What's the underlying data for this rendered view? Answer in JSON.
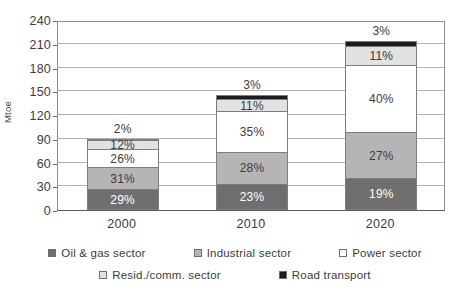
{
  "title_fragment": "",
  "axis": {
    "ylabel": "Mtoe",
    "yticks": [
      "0",
      "30",
      "60",
      "90",
      "120",
      "150",
      "180",
      "210",
      "240"
    ]
  },
  "categories": [
    "2000",
    "2010",
    "2020"
  ],
  "legend": {
    "row1": [
      {
        "label": "Oil & gas sector",
        "swatch": "#6f6f6f"
      },
      {
        "label": "Industrial sector",
        "swatch": "#b5b5b5"
      },
      {
        "label": "Power sector",
        "swatch": "#ffffff"
      }
    ],
    "row2": [
      {
        "label": "Resid./comm. sector",
        "swatch": "#e2e2e2"
      },
      {
        "label": "Road transport",
        "swatch": "#1c1c1c"
      }
    ]
  },
  "labels": {
    "2000": {
      "oil_gas": "29%",
      "industrial": "31%",
      "power": "26%",
      "resid": "12%",
      "road": "2%"
    },
    "2010": {
      "oil_gas": "23%",
      "industrial": "28%",
      "power": "35%",
      "resid": "11%",
      "road": "3%"
    },
    "2020": {
      "oil_gas": "19%",
      "industrial": "27%",
      "power": "40%",
      "resid": "11%",
      "road": "3%"
    }
  },
  "chart_data": {
    "type": "bar",
    "subtype": "stacked-bar",
    "title": "",
    "xlabel": "",
    "ylabel": "Mtoe",
    "ylim": [
      0,
      240
    ],
    "ytick_step": 30,
    "yticks": [
      0,
      30,
      60,
      90,
      120,
      150,
      180,
      210,
      240
    ],
    "grid": "horizontal",
    "legend_position": "bottom",
    "categories": [
      "2000",
      "2010",
      "2020"
    ],
    "totals_mtoe": [
      90,
      145,
      213
    ],
    "value_unit": "Mtoe",
    "label_unit": "percent of total",
    "series": [
      {
        "name": "Oil & gas sector",
        "color": "#6f6f6f",
        "percent": [
          29,
          23,
          19
        ],
        "values": [
          26.1,
          33.4,
          40.5
        ]
      },
      {
        "name": "Industrial sector",
        "color": "#b5b5b5",
        "percent": [
          31,
          28,
          27
        ],
        "values": [
          27.9,
          40.6,
          57.5
        ]
      },
      {
        "name": "Power sector",
        "color": "#ffffff",
        "percent": [
          26,
          35,
          40
        ],
        "values": [
          23.4,
          50.8,
          85.2
        ]
      },
      {
        "name": "Resid./comm. sector",
        "color": "#e2e2e2",
        "percent": [
          12,
          11,
          11
        ],
        "values": [
          10.8,
          16.0,
          23.4
        ]
      },
      {
        "name": "Road transport",
        "color": "#1c1c1c",
        "percent": [
          2,
          3,
          3
        ],
        "values": [
          1.8,
          4.4,
          6.4
        ]
      }
    ]
  }
}
